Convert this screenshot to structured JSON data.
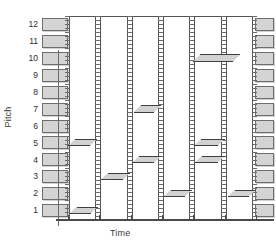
{
  "chart_data": {
    "type": "scatter",
    "title": "",
    "xlabel": "Time",
    "ylabel": "Pitch",
    "ylim": [
      0.5,
      12.5
    ],
    "xlim": [
      0,
      6
    ],
    "grid": false,
    "legend": null,
    "y_ticks": [
      12,
      11,
      10,
      9,
      8,
      7,
      6,
      5,
      4,
      3,
      2,
      1
    ],
    "x_ticks": [],
    "notes": [
      {
        "id": "note-1",
        "pitch": 1,
        "start": 0.05,
        "end": 0.95,
        "column": 1
      },
      {
        "id": "note-2",
        "pitch": 5,
        "start": 0.0,
        "end": 0.92,
        "column": 1
      },
      {
        "id": "note-3",
        "pitch": 3,
        "start": 1.05,
        "end": 1.98,
        "column": 2
      },
      {
        "id": "note-4",
        "pitch": 4,
        "start": 2.05,
        "end": 2.98,
        "column": 3
      },
      {
        "id": "note-5",
        "pitch": 7,
        "start": 2.1,
        "end": 2.98,
        "column": 3
      },
      {
        "id": "note-6",
        "pitch": 2,
        "start": 3.05,
        "end": 3.95,
        "column": 4
      },
      {
        "id": "note-7",
        "pitch": 10,
        "start": 4.0,
        "end": 5.5,
        "column": 5
      },
      {
        "id": "note-8",
        "pitch": 5,
        "start": 4.02,
        "end": 5.0,
        "column": 5
      },
      {
        "id": "note-9",
        "pitch": 4,
        "start": 4.05,
        "end": 5.0,
        "column": 5
      },
      {
        "id": "note-10",
        "pitch": 2,
        "start": 5.1,
        "end": 6.0,
        "column": 6
      }
    ],
    "columns": 6,
    "keys_left": [
      12,
      11,
      10,
      9,
      8,
      7,
      6,
      5,
      4,
      3,
      2,
      1
    ],
    "keys_right": [
      12,
      11,
      10,
      9,
      8,
      7,
      6,
      5,
      4,
      3,
      2,
      1
    ]
  },
  "axes": {
    "ylabel": "Pitch",
    "xlabel": "Time",
    "yticks": [
      "12",
      "11",
      "10",
      "9",
      "8",
      "7",
      "6",
      "5",
      "4",
      "3",
      "2",
      "1"
    ]
  }
}
